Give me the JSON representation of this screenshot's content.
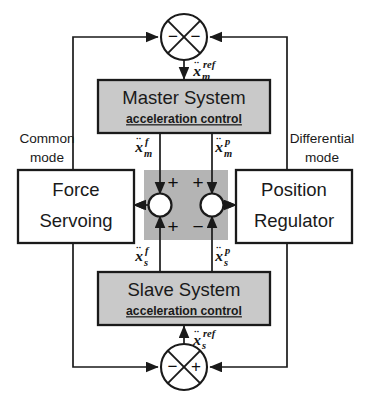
{
  "diagram": {
    "type": "control-block-diagram",
    "title_visible": false,
    "colors": {
      "line": "#1a1a1a",
      "block_fill_shaded": "#c9c9c9",
      "block_fill_plain": "#ffffff",
      "center_region_fill": "#b4b4b4",
      "text": "#1a1a1a",
      "background": "#ffffff"
    },
    "blocks": {
      "master": {
        "title": "Master System",
        "subtitle": "acceleration control",
        "shaded": true
      },
      "slave": {
        "title": "Slave System",
        "subtitle": "acceleration control",
        "shaded": true
      },
      "force": {
        "line1": "Force",
        "line2": "Servoing",
        "shaded": false
      },
      "position": {
        "line1": "Position",
        "line2": "Regulator",
        "shaded": false
      }
    },
    "mode_labels": {
      "left_line1": "Common",
      "left_line2": "mode",
      "right_line1": "Differential",
      "right_line2": "mode"
    },
    "signals": {
      "master_ref": {
        "base": "x",
        "dots": "¨",
        "sub": "m",
        "sup": "ref",
        "text": "ẍ_m^ref"
      },
      "slave_ref": {
        "base": "x",
        "dots": "¨",
        "sub": "s",
        "sup": "ref",
        "text": "ẍ_s^ref"
      },
      "master_force": {
        "base": "x",
        "dots": "¨",
        "sub": "m",
        "sup": "f",
        "text": "ẍ_m^f"
      },
      "master_position": {
        "base": "x",
        "dots": "¨",
        "sub": "m",
        "sup": "p",
        "text": "ẍ_m^p"
      },
      "slave_force": {
        "base": "x",
        "dots": "¨",
        "sub": "s",
        "sup": "f",
        "text": "ẍ_s^f"
      },
      "slave_position": {
        "base": "x",
        "dots": "¨",
        "sub": "s",
        "sup": "p",
        "text": "ẍ_s^p"
      }
    },
    "junctions": {
      "top": {
        "name": "master-reference-summing-junction",
        "style": "crossed-circle",
        "sign_left": "−",
        "sign_right": "−",
        "output_direction": "down"
      },
      "bottom": {
        "name": "slave-reference-summing-junction",
        "style": "crossed-circle",
        "sign_left": "−",
        "sign_right": "+",
        "output_direction": "up"
      },
      "center_left": {
        "name": "common-mode-summing-node",
        "style": "open-circle",
        "sign_top": "+",
        "sign_bottom": "+",
        "output_direction": "left"
      },
      "center_right": {
        "name": "differential-mode-summing-node",
        "style": "open-circle",
        "sign_top": "+",
        "sign_bottom": "−",
        "output_direction": "right"
      }
    }
  }
}
